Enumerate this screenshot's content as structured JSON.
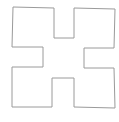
{
  "diagram": {
    "shape": "cross-notched-square",
    "stroke_color": "#9a9a9a",
    "fill_color": "#ffffff",
    "background": "#ffffff",
    "stroke_width": 1,
    "points": "13,7 54,8 54,38 74,38 74,8 115,9 114,48 84,48 84,68 114,68 115,108 74,107 74,78 52,78 52,107 12,107 12,67 43,67 43,47 12,47"
  }
}
